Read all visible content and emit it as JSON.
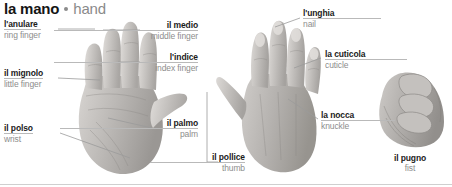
{
  "title": {
    "italian": "la mano",
    "separator": "•",
    "english": "hand"
  },
  "colors": {
    "italian_text": "#1b1b1b",
    "english_text": "#8d8d8d",
    "leader_line": "#9a9a9a",
    "background": "#ffffff",
    "baseline_rule": "#cfcfcf"
  },
  "figures": [
    {
      "id": "palm-view",
      "caption_italian": "",
      "caption_english": ""
    },
    {
      "id": "back-view",
      "caption_italian": "",
      "caption_english": ""
    },
    {
      "id": "fist-view",
      "caption_italian": "il pugno",
      "caption_english": "fist"
    }
  ],
  "labels": [
    {
      "id": "ring-finger",
      "italian": "l'anulare",
      "english": "ring finger",
      "align": "left"
    },
    {
      "id": "little-finger",
      "italian": "il mignolo",
      "english": "little finger",
      "align": "left"
    },
    {
      "id": "wrist",
      "italian": "il polso",
      "english": "wrist",
      "align": "left"
    },
    {
      "id": "middle-finger",
      "italian": "il medio",
      "english": "middle finger",
      "align": "right"
    },
    {
      "id": "index-finger",
      "italian": "l'indice",
      "english": "index finger",
      "align": "right"
    },
    {
      "id": "palm",
      "italian": "il palmo",
      "english": "palm",
      "align": "right"
    },
    {
      "id": "thumb",
      "italian": "il pollice",
      "english": "thumb",
      "align": "right"
    },
    {
      "id": "nail",
      "italian": "l'unghia",
      "english": "nail",
      "align": "left"
    },
    {
      "id": "cuticle",
      "italian": "la cuticola",
      "english": "cuticle",
      "align": "left"
    },
    {
      "id": "knuckle",
      "italian": "la nocca",
      "english": "knuckle",
      "align": "left"
    },
    {
      "id": "fist",
      "italian": "il pugno",
      "english": "fist",
      "align": "center"
    }
  ]
}
